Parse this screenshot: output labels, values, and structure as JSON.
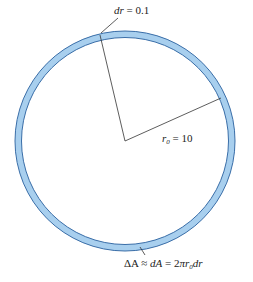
{
  "diagram": {
    "ring": {
      "center": [
        125,
        141
      ],
      "outer_radius": 110,
      "inner_radius": 103.5,
      "fill_color": "#a8cfee",
      "stroke_color": "#3a6ea8"
    },
    "radius_lines": [
      {
        "from": [
          125,
          141
        ],
        "to": [
          100,
          35
        ]
      },
      {
        "from": [
          125,
          141
        ],
        "to": [
          221,
          98
        ]
      }
    ],
    "labels": {
      "dr": {
        "var": "dr",
        "eq": " = 0.1"
      },
      "r0": {
        "var": "r",
        "sub": "0",
        "eq": " = 10"
      },
      "area": {
        "lhs": "ΔA ≈ ",
        "mid": "dA",
        "eq": " = 2",
        "pi": "π",
        "r": "r",
        "sub": "0",
        "dr": "dr"
      }
    },
    "leaders": [
      {
        "from": [
          120,
          16
        ],
        "to": [
          101,
          33
        ]
      },
      {
        "from": [
          139,
          246
        ],
        "to": [
          144,
          254
        ]
      }
    ]
  }
}
